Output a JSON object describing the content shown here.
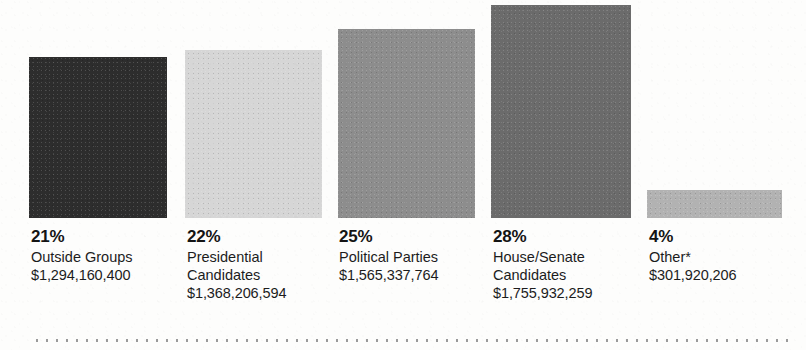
{
  "chart_data": {
    "type": "bar",
    "title": "",
    "subtitle": "",
    "xlabel": "",
    "ylabel": "",
    "grid": false,
    "legend": "none",
    "axis_visible": false,
    "value_unit": "USD",
    "categories": [
      "Outside Groups",
      "Presidential Candidates",
      "Political Parties",
      "House/Senate Candidates",
      "Other*"
    ],
    "percent_labels": [
      "21%",
      "22%",
      "25%",
      "28%",
      "4%"
    ],
    "percents": [
      21,
      22,
      25,
      28,
      4
    ],
    "amount_labels": [
      "$1,294,160,400",
      "$1,368,206,594",
      "$1,565,337,764",
      "$1,755,932,259",
      "$301,920,206"
    ],
    "values": [
      1294160400,
      1368206594,
      1565337764,
      1755932259,
      301920206
    ],
    "bar_colors": [
      "#2d2d2d",
      "#d6d6d6",
      "#8d8d8d",
      "#6b6b6b",
      "#b2b2b2"
    ],
    "ylim": [
      0,
      1755932259
    ],
    "footnote_marker": "*"
  },
  "bars": [
    {
      "name": "outside-groups",
      "percent": "21%",
      "category_line1": "Outside Groups",
      "category_line2": "",
      "amount": "$1,294,160,400",
      "color": "#2d2d2d",
      "x": 29,
      "y": 57,
      "w": 138,
      "h": 161,
      "label_x": 31,
      "label_y": 227
    },
    {
      "name": "presidential-candidates",
      "percent": "22%",
      "category_line1": "Presidential",
      "category_line2": "Candidates",
      "amount": "$1,368,206,594",
      "color": "#d6d6d6",
      "x": 185,
      "y": 50,
      "w": 137,
      "h": 168,
      "label_x": 187,
      "label_y": 227
    },
    {
      "name": "political-parties",
      "percent": "25%",
      "category_line1": "Political Parties",
      "category_line2": "",
      "amount": "$1,565,337,764",
      "color": "#8d8d8d",
      "x": 338,
      "y": 29,
      "w": 137,
      "h": 189,
      "label_x": 339,
      "label_y": 227
    },
    {
      "name": "house-senate-candidates",
      "percent": "28%",
      "category_line1": "House/Senate",
      "category_line2": "Candidates",
      "amount": "$1,755,932,259",
      "color": "#6b6b6b",
      "x": 491,
      "y": 5,
      "w": 140,
      "h": 213,
      "label_x": 493,
      "label_y": 227
    },
    {
      "name": "other",
      "percent": "4%",
      "category_line1": "Other*",
      "category_line2": "",
      "amount": "$301,920,206",
      "color": "#b2b2b2",
      "x": 647,
      "y": 190,
      "w": 135,
      "h": 28,
      "label_x": 649,
      "label_y": 227
    }
  ]
}
